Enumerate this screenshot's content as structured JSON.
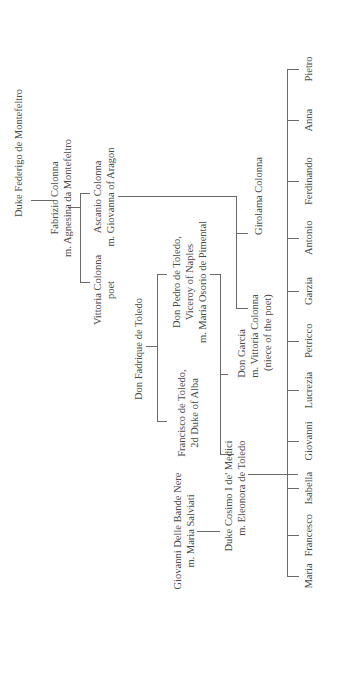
{
  "diagram": {
    "orientation": "rotated 90deg counter-clockwise",
    "line_color": "#6a6a6a",
    "text_color": "#4a4a4a"
  },
  "nodes": {
    "federigo": {
      "lines": [
        "Duke Federigo de Montefeltro"
      ]
    },
    "fabrizio": {
      "lines": [
        "Fabrizio Colonna",
        "m. Agnesina da Montefeltro"
      ]
    },
    "vittoria_poet": {
      "lines": [
        "Vittoria Colonna",
        "poet"
      ]
    },
    "ascanio": {
      "lines": [
        "Ascanio Colonna",
        "m. Giovanna of Aragon"
      ]
    },
    "fadrique": {
      "lines": [
        "Don Fadrique de Toledo"
      ]
    },
    "francisco": {
      "lines": [
        "Francisco de Toledo,",
        "2d Duke of Alba"
      ]
    },
    "pedro": {
      "lines": [
        "Don Pedro de Toledo,",
        "Viceroy of Naples",
        "m. María Osorio de Pimental"
      ]
    },
    "girolama": {
      "lines": [
        "Girolama Colonna"
      ]
    },
    "garcia": {
      "lines": [
        "Don García",
        "m. Vittoria Colonna",
        "(niece of the poet)"
      ]
    },
    "giovanni_bande": {
      "lines": [
        "Giovanni Delle Bande Nere",
        "m. Maria Salviati"
      ]
    },
    "cosimo": {
      "lines": [
        "Duke Cosimo I de' Medici",
        "m. Eleonora de Toledo"
      ]
    }
  },
  "children": [
    "Maria",
    "Francesco",
    "Isabella",
    "Giovanni",
    "Lucrezia",
    "Petricco",
    "Garzia",
    "Antonio",
    "Ferdinando",
    "Anna",
    "Pietro"
  ]
}
